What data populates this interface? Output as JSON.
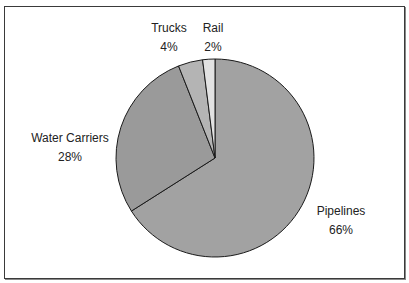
{
  "chart_data": {
    "type": "pie",
    "title": "",
    "categories": [
      "Pipelines",
      "Water Carriers",
      "Trucks",
      "Rail"
    ],
    "values": [
      66,
      28,
      4,
      2
    ],
    "unit": "%",
    "colors": [
      "#a2a2a2",
      "#9a9a9a",
      "#b4b4b4",
      "#e2e2e2"
    ],
    "start_angle_deg": 0,
    "direction": "clockwise",
    "legend": "none",
    "data_labels": [
      "Pipelines 66%",
      "Water Carriers 28%",
      "Trucks 4%",
      "Rail 2%"
    ]
  },
  "labels": {
    "pipelines": {
      "name": "Pipelines",
      "pct": "66%"
    },
    "water": {
      "name": "Water Carriers",
      "pct": "28%"
    },
    "trucks": {
      "name": "Trucks",
      "pct": "4%"
    },
    "rail": {
      "name": "Rail",
      "pct": "2%"
    }
  }
}
